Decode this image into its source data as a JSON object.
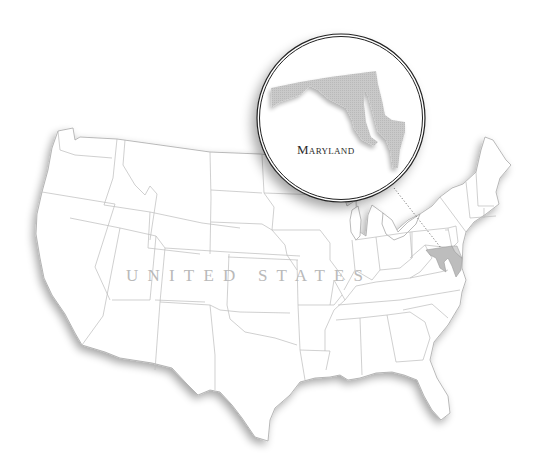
{
  "map": {
    "country_label": "UNITED STATES",
    "highlighted_state": "Maryland",
    "callout_label": "Maryland",
    "colors": {
      "background": "#ffffff",
      "state_fill": "#ffffff",
      "state_border": "#b5b5b5",
      "highlight_fill": "#c4c4c4",
      "circle_ring": "#222222",
      "label_color": "#b9b9b9",
      "callout_text": "#2a2a2a"
    },
    "callout": {
      "shape": "circle",
      "center_x": 341,
      "center_y": 118,
      "radius": 84,
      "leader_line": "dotted",
      "leader_from": [
        394,
        188
      ],
      "leader_to": [
        441,
        248
      ]
    }
  }
}
